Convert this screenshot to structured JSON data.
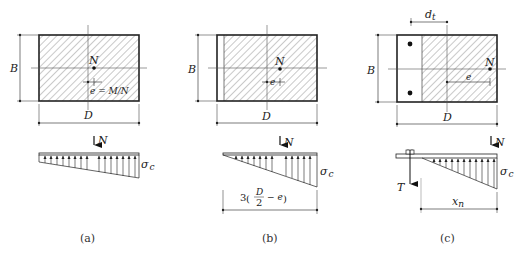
{
  "figure": {
    "panels": [
      {
        "id": "a",
        "caption": "(a)",
        "section": {
          "width_label": "D",
          "height_label": "B",
          "load_label": "N",
          "eccentricity_label": "e = M/N"
        },
        "stress": {
          "load_label": "N",
          "stress_label": "σ",
          "stress_sub": "c"
        }
      },
      {
        "id": "b",
        "caption": "(b)",
        "section": {
          "width_label": "D",
          "height_label": "B",
          "load_label": "N",
          "eccentricity_label": "e"
        },
        "stress": {
          "load_label": "N",
          "stress_label": "σ",
          "stress_sub": "c",
          "dimension_prefix": "3",
          "dimension_num": "D",
          "dimension_den": "2",
          "dimension_suffix": "− e"
        }
      },
      {
        "id": "c",
        "caption": "(c)",
        "section": {
          "width_label": "D",
          "height_label": "B",
          "load_label": "N",
          "eccentricity_label": "e",
          "bolt_distance_label": "d",
          "bolt_distance_sub": "t"
        },
        "stress": {
          "load_label": "N",
          "tension_label": "T",
          "stress_label": "σ",
          "stress_sub": "c",
          "neutral_axis_label": "x",
          "neutral_axis_sub": "n"
        }
      }
    ]
  }
}
